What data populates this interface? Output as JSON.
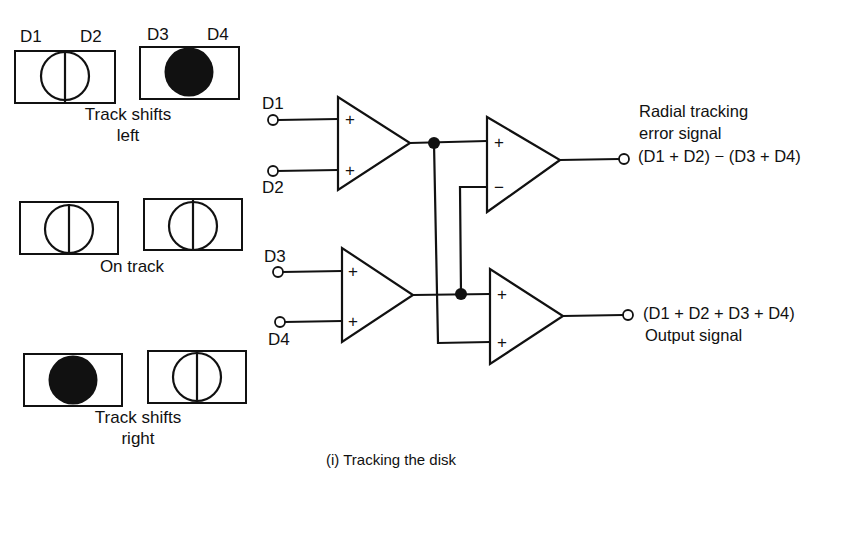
{
  "figure": {
    "caption": "(i) Tracking the disk"
  },
  "photodetectors": {
    "labels": {
      "d1": "D1",
      "d2": "D2",
      "d3": "D3",
      "d4": "D4"
    },
    "states": [
      {
        "id": "track-shifts-left",
        "label_line1": "Track shifts",
        "label_line2": "left",
        "pair_a": "split-circle",
        "pair_b": "filled-spot"
      },
      {
        "id": "on-track",
        "label_line1": "On track",
        "label_line2": "",
        "pair_a": "split-circle",
        "pair_b": "split-circle"
      },
      {
        "id": "track-shifts-right",
        "label_line1": "Track shifts",
        "label_line2": "right",
        "pair_a": "filled-spot",
        "pair_b": "split-circle"
      }
    ]
  },
  "circuit": {
    "inputs": {
      "d1": "D1",
      "d2": "D2",
      "d3": "D3",
      "d4": "D4"
    },
    "amplifiers": [
      {
        "id": "sum-d1-d2",
        "inputs": [
          "+",
          "+"
        ]
      },
      {
        "id": "sum-d3-d4",
        "inputs": [
          "+",
          "+"
        ]
      },
      {
        "id": "difference",
        "inputs": [
          "+",
          "−"
        ]
      },
      {
        "id": "total-sum",
        "inputs": [
          "+",
          "+"
        ]
      }
    ],
    "outputs": {
      "error": {
        "title_line1": "Radial tracking",
        "title_line2": "error signal",
        "formula": "(D1 + D2) − (D3 + D4)"
      },
      "sum": {
        "formula": "(D1 + D2 + D3 + D4)",
        "title": "Output signal"
      }
    }
  }
}
